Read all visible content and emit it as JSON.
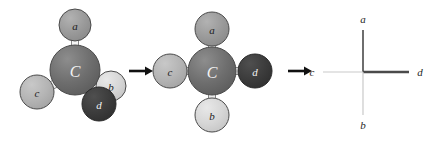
{
  "figure": {
    "background": "#ffffff"
  },
  "colors": {
    "carbon": "#6e6e6e",
    "atom_a": "#9a9a9a",
    "atom_b": "#d6d6d6",
    "atom_c": "#b4b4b4",
    "atom_d": "#3c3c3c",
    "outline": "#4a4a4a",
    "bond_fill": "#f0f0f0",
    "bond_stroke": "#6b6b6b",
    "arrow": "#111111",
    "line_dark": "#4a4a4a",
    "line_light": "#c9c9c9",
    "label_dark": "#1c1c1c",
    "label_light": "#f2f2f2"
  },
  "structure_1": {
    "name": "tetrahedral-3d-model",
    "center": {
      "label": "C",
      "cx": 75,
      "cy": 70,
      "r": 25,
      "color": "#6e6e6e",
      "text_color": "#f2f2f2"
    },
    "atoms": [
      {
        "id": "a",
        "label": "a",
        "cx": 75,
        "cy": 25,
        "r": 16,
        "color": "#9a9a9a",
        "text_color": "#1c1c1c"
      },
      {
        "id": "c",
        "label": "c",
        "cx": 37,
        "cy": 92,
        "r": 17,
        "color": "#b4b4b4",
        "text_color": "#1c1c1c"
      },
      {
        "id": "b",
        "label": "b",
        "cx": 111,
        "cy": 86,
        "r": 15,
        "color": "#d6d6d6",
        "text_color": "#1c1c1c"
      },
      {
        "id": "d",
        "label": "d",
        "cx": 99,
        "cy": 104,
        "r": 17,
        "color": "#3c3c3c",
        "text_color": "#f2f2f2"
      }
    ]
  },
  "structure_2": {
    "name": "cross-ball-and-stick",
    "center": {
      "label": "C",
      "cx": 212,
      "cy": 71,
      "r": 24,
      "color": "#6e6e6e",
      "text_color": "#f2f2f2"
    },
    "atoms": [
      {
        "id": "a",
        "label": "a",
        "cx": 212,
        "cy": 29,
        "r": 17,
        "color": "#9a9a9a",
        "text_color": "#1c1c1c"
      },
      {
        "id": "b",
        "label": "b",
        "cx": 212,
        "cy": 115,
        "r": 17,
        "color": "#d6d6d6",
        "text_color": "#1c1c1c"
      },
      {
        "id": "c",
        "label": "c",
        "cx": 170,
        "cy": 71,
        "r": 17,
        "color": "#b4b4b4",
        "text_color": "#1c1c1c"
      },
      {
        "id": "d",
        "label": "d",
        "cx": 255,
        "cy": 71,
        "r": 17,
        "color": "#3c3c3c",
        "text_color": "#f2f2f2"
      }
    ]
  },
  "structure_3": {
    "name": "cross-line-projection",
    "center": {
      "x": 363,
      "y": 72
    },
    "bonds": [
      {
        "id": "a",
        "direction": "up",
        "x2": 363,
        "y2": 30,
        "color": "#4a4a4a",
        "width": 1.6
      },
      {
        "id": "d",
        "direction": "right",
        "x2": 409,
        "y2": 72,
        "color": "#4a4a4a",
        "width": 2.4
      },
      {
        "id": "c",
        "direction": "left",
        "x2": 323,
        "y2": 72,
        "color": "#c9c9c9",
        "width": 1.2
      },
      {
        "id": "b",
        "direction": "down",
        "x2": 363,
        "y2": 115,
        "color": "#c9c9c9",
        "width": 1.2
      }
    ],
    "labels": [
      {
        "id": "a",
        "text": "a",
        "x": 363,
        "y": 19
      },
      {
        "id": "d",
        "text": "d",
        "x": 420,
        "y": 72
      },
      {
        "id": "c",
        "text": "c",
        "x": 312,
        "y": 72
      },
      {
        "id": "b",
        "text": "b",
        "x": 363,
        "y": 125
      }
    ]
  },
  "arrows": [
    {
      "id": "arrow-1",
      "x": 129,
      "y": 71,
      "length": 22,
      "color": "#111111"
    },
    {
      "id": "arrow-2",
      "x": 288,
      "y": 71,
      "length": 22,
      "color": "#111111"
    }
  ]
}
